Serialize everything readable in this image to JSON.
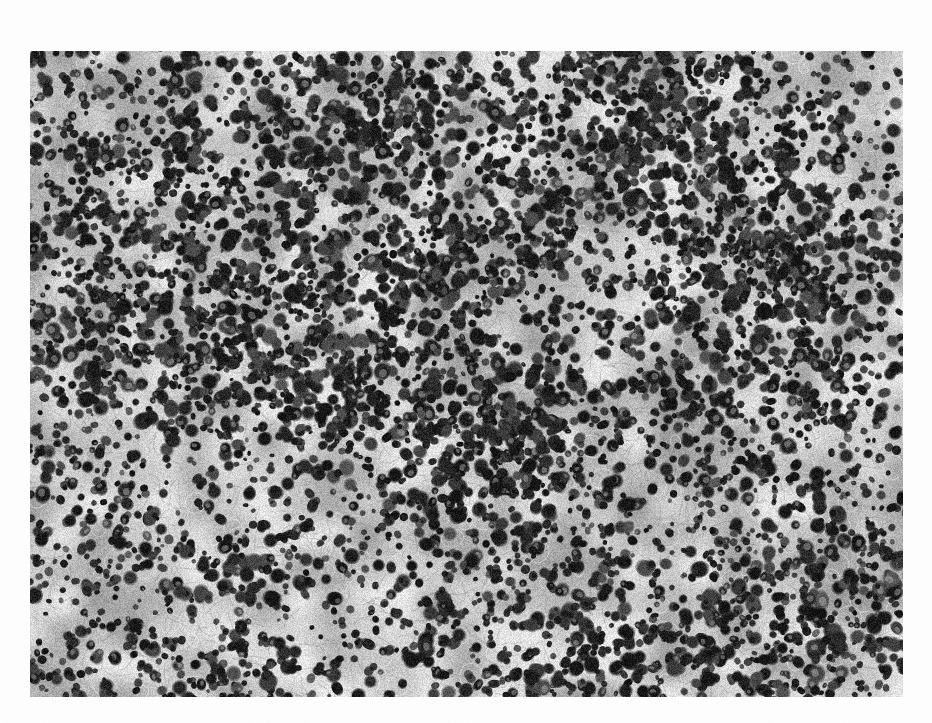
{
  "page": {
    "background_color": "#fdfdfd",
    "width": 932,
    "height": 723,
    "caption": ""
  },
  "figure": {
    "name": "histopathology-micrograph",
    "modality": "light-microscopy",
    "stain": "hematoxylin-eosin",
    "rendering": "grayscale",
    "bounds": {
      "x": 30,
      "y": 51,
      "width": 873,
      "height": 646
    },
    "border_color": "#dadada",
    "tone": {
      "background_gray": "#b4b4b4",
      "light_gray": "#e2e2e2",
      "mid_gray": "#9a9a9a",
      "nucleus_dark": "#1a1a1a",
      "nucleus_black": "#050505",
      "highlight": "#f2f2f2"
    },
    "texture": {
      "description": "dense scattered dark nuclei over pale cytoplasm with lighter stromal bands",
      "nuclei_count": 5200,
      "nucleus_min_radius_px": 3.0,
      "nucleus_max_radius_px": 8.5,
      "cluster_count": 46,
      "pale_band_count": 11,
      "grain_strength": 0.17,
      "seed": 20250617
    }
  }
}
